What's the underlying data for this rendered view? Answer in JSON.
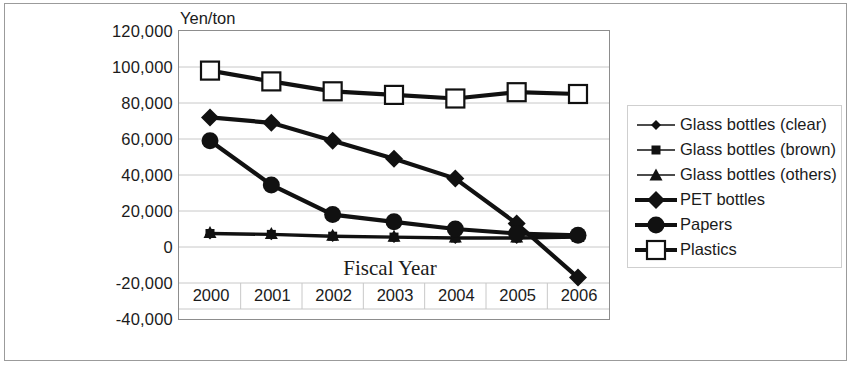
{
  "axis_unit_label": "Yen/ton",
  "xaxis_title": "Fiscal Year",
  "yticks": [
    "120,000",
    "100,000",
    "80,000",
    "60,000",
    "40,000",
    "20,000",
    "0",
    "-20,000",
    "-40,000"
  ],
  "xticks": [
    "2000",
    "2001",
    "2002",
    "2003",
    "2004",
    "2005",
    "2006"
  ],
  "legend": {
    "items": [
      {
        "label": "Glass bottles (clear)",
        "marker": "diamond-small",
        "weight": "thin"
      },
      {
        "label": "Glass bottles (brown)",
        "marker": "square-filled-small",
        "weight": "thin"
      },
      {
        "label": "Glass bottles (others)",
        "marker": "triangle-filled",
        "weight": "thin"
      },
      {
        "label": "PET bottles",
        "marker": "diamond-large",
        "weight": "thick"
      },
      {
        "label": "Papers",
        "marker": "circle-filled",
        "weight": "thick"
      },
      {
        "label": "Plastics",
        "marker": "square-open",
        "weight": "thick"
      }
    ]
  },
  "chart_data": {
    "type": "line",
    "title": "",
    "xlabel": "Fiscal Year",
    "ylabel": "Yen/ton",
    "ylim": [
      -40000,
      120000
    ],
    "ytick_step": 20000,
    "grid": true,
    "legend_position": "right",
    "categories": [
      "2000",
      "2001",
      "2002",
      "2003",
      "2004",
      "2005",
      "2006"
    ],
    "series": [
      {
        "name": "Glass bottles (clear)",
        "values": [
          7000,
          6500,
          5500,
          5000,
          4500,
          4500,
          5000
        ]
      },
      {
        "name": "Glass bottles (brown)",
        "values": [
          7500,
          7000,
          6000,
          5500,
          5000,
          5000,
          5500
        ]
      },
      {
        "name": "Glass bottles (others)",
        "values": [
          8000,
          7500,
          6500,
          6000,
          5500,
          5500,
          6000
        ]
      },
      {
        "name": "PET bottles",
        "values": [
          72000,
          69000,
          59000,
          49000,
          38000,
          13000,
          -17000
        ]
      },
      {
        "name": "Papers",
        "values": [
          59000,
          34500,
          18000,
          14000,
          10000,
          7500,
          6500
        ]
      },
      {
        "name": "Plastics",
        "values": [
          98000,
          92000,
          86500,
          84500,
          82500,
          86000,
          85000
        ]
      }
    ]
  }
}
